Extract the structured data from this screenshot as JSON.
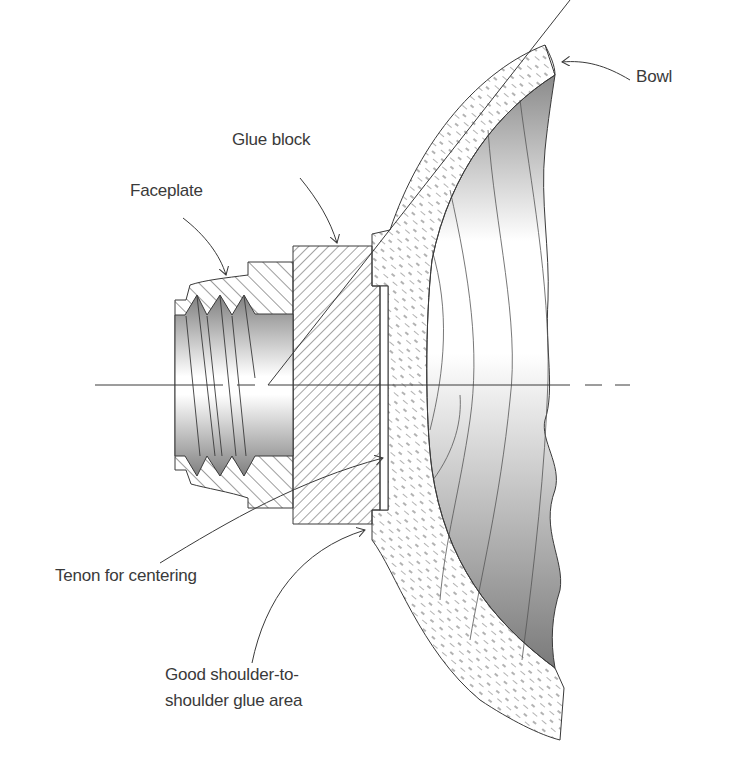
{
  "diagram": {
    "labels": {
      "bowl": "Bowl",
      "glue_block": "Glue block",
      "faceplate": "Faceplate",
      "tenon": "Tenon for centering",
      "shoulder_line1": "Good shoulder-to-",
      "shoulder_line2": "shoulder glue area"
    },
    "components": [
      "Faceplate",
      "Glue block",
      "Tenon",
      "Bowl",
      "Centerline"
    ],
    "colors": {
      "line": "#3a3a3a",
      "hatch": "#4a4a4a",
      "shade_dark": "#7a7a7a",
      "shade_light": "#ffffff",
      "background": "#ffffff"
    }
  }
}
